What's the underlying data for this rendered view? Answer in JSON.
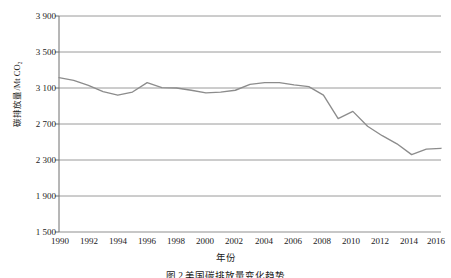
{
  "chart_data": {
    "type": "line",
    "title": "",
    "caption": "图 2  美国碳排放量变化趋势",
    "xlabel": "年份",
    "ylabel": "碳排放量/Mt CO₂",
    "xlim": [
      1990,
      2016
    ],
    "ylim": [
      1500,
      3900
    ],
    "ytick_labels": [
      "3 900",
      "3 500",
      "3 100",
      "2 700",
      "2 300",
      "1 900",
      "1 500"
    ],
    "ytick_values": [
      3900,
      3500,
      3100,
      2700,
      2300,
      1900,
      1500
    ],
    "xtick_labels": [
      "1990",
      "1992",
      "1994",
      "1996",
      "1998",
      "2000",
      "2002",
      "2004",
      "2006",
      "2008",
      "2010",
      "2012",
      "2014",
      "2016"
    ],
    "xtick_values": [
      1990,
      1992,
      1994,
      1996,
      1998,
      2000,
      2002,
      2004,
      2006,
      2008,
      2010,
      2012,
      2014,
      2016
    ],
    "grid": true,
    "legend": "none",
    "line_color": "#8c8c8c",
    "x": [
      1990,
      1991,
      1992,
      1993,
      1994,
      1995,
      1996,
      1997,
      1998,
      1999,
      2000,
      2001,
      2002,
      2003,
      2004,
      2005,
      2006,
      2007,
      2008,
      2009,
      2010,
      2011,
      2012,
      2013,
      2014,
      2015,
      2016
    ],
    "values": [
      3215,
      3185,
      3130,
      3060,
      3020,
      3055,
      3160,
      3105,
      3100,
      3075,
      3045,
      3055,
      3075,
      3140,
      3160,
      3160,
      3135,
      3115,
      3020,
      2760,
      2840,
      2675,
      2570,
      2480,
      2360,
      2420,
      2430
    ],
    "series": [
      {
        "name": "碳排放量",
        "values": [
          3215,
          3185,
          3130,
          3060,
          3020,
          3055,
          3160,
          3105,
          3100,
          3075,
          3045,
          3055,
          3075,
          3140,
          3160,
          3160,
          3135,
          3115,
          3020,
          2760,
          2840,
          2675,
          2570,
          2480,
          2360,
          2420,
          2430
        ]
      }
    ]
  },
  "colors": {
    "line": "#8c8c8c",
    "grid": "#8f8f8f",
    "axis": "#6e6e6e",
    "text": "#1b1b1b",
    "background": "#ffffff"
  }
}
